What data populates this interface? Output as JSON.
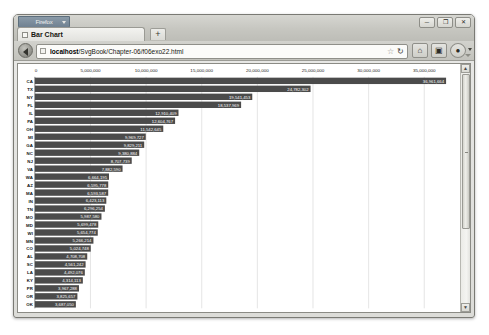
{
  "window": {
    "firefox_button_label": "Firefox",
    "controls": {
      "minimize": "─",
      "maximize": "❐",
      "close": "✕"
    }
  },
  "tabbar": {
    "tabs": [
      {
        "label": "Bar Chart",
        "favicon": "page-icon"
      }
    ],
    "new_tab_label": "+"
  },
  "navbar": {
    "back_tooltip": "Back",
    "url_host": "localhost",
    "url_path": "/SvgBook/Chapter-06/f06exo22.html",
    "url_full": "localhost/SvgBook/Chapter-06/f06exo22.html",
    "star_glyph": "☆",
    "reload_glyph": "↻",
    "home_glyph": "⌂",
    "library_glyph": "▣",
    "menu_glyph": "●"
  },
  "scrollbar": {
    "up_glyph": "▲",
    "down_glyph": "▼"
  },
  "chart_data": {
    "type": "bar",
    "orientation": "horizontal",
    "title": "",
    "xlabel": "",
    "ylabel": "",
    "xlim": [
      0,
      37500000
    ],
    "grid": true,
    "legend": "none",
    "xticks": [
      0,
      5000000,
      10000000,
      15000000,
      20000000,
      25000000,
      30000000,
      35000000
    ],
    "xtick_labels": [
      "0",
      "5,000,000",
      "10,000,000",
      "15,000,000",
      "20,000,000",
      "25,000,000",
      "30,000,000",
      "35,000,000"
    ],
    "categories": [
      "CA",
      "TX",
      "NY",
      "FL",
      "IL",
      "PA",
      "OH",
      "MI",
      "GA",
      "NC",
      "NJ",
      "VA",
      "WA",
      "AZ",
      "MA",
      "IN",
      "TN",
      "MO",
      "MD",
      "WI",
      "MN",
      "CO",
      "AL",
      "SC",
      "LA",
      "KY",
      "PR",
      "OR",
      "OK"
    ],
    "values": [
      36961664,
      24782302,
      19541453,
      18537969,
      12910409,
      12604767,
      11542645,
      9969727,
      9829211,
      9380884,
      8707739,
      7882590,
      6664195,
      6595778,
      6593587,
      6423113,
      6296254,
      5987580,
      5699478,
      5654774,
      5266214,
      5024748,
      4708708,
      4561242,
      4492076,
      4314113,
      3967288,
      3825657,
      3687050
    ],
    "value_labels": [
      "36,961,664",
      "24,782,302",
      "19,541,453",
      "18,537,969",
      "12,910,409",
      "12,604,767",
      "11,542,645",
      "9,969,727",
      "9,829,211",
      "9,380,884",
      "8,707,739",
      "7,882,590",
      "6,664,195",
      "6,595,778",
      "6,593,587",
      "6,423,113",
      "6,296,254",
      "5,987,580",
      "5,699,478",
      "5,654,774",
      "5,266,214",
      "5,024,748",
      "4,708,708",
      "4,561,242",
      "4,492,076",
      "4,314,113",
      "3,967,288",
      "3,825,657",
      "3,687,050"
    ],
    "colors": {
      "bar": "#4b4b4b",
      "bar_label": "#ffffff",
      "grid": "#c9c9c9",
      "axis": "#555555",
      "background": "#ffffff"
    }
  }
}
